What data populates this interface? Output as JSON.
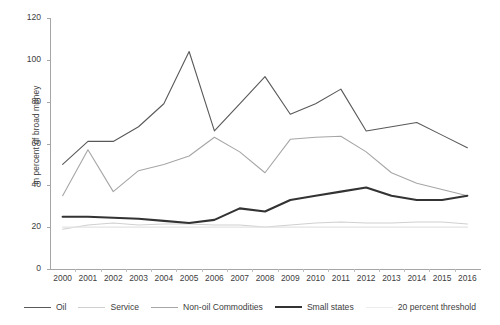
{
  "chart_data": {
    "type": "line",
    "title": "",
    "xlabel": "",
    "ylabel": "in percent of broad money",
    "ylim": [
      0,
      120
    ],
    "ytick_labels": [
      "0",
      "20",
      "40",
      "60",
      "80",
      "100",
      "120"
    ],
    "yticks": [
      0,
      20,
      40,
      60,
      80,
      100,
      120
    ],
    "grid": false,
    "legend_position": "bottom",
    "categories": [
      "2000",
      "2001",
      "2002",
      "2003",
      "2004",
      "2005",
      "2006",
      "2007",
      "2008",
      "2009",
      "2010",
      "2011",
      "2012",
      "2013",
      "2014",
      "2015",
      "2016"
    ],
    "series": [
      {
        "name": "Oil",
        "color": "#595959",
        "width": 1.1,
        "values": [
          50,
          61,
          61,
          68,
          79,
          104,
          66,
          79,
          92,
          74,
          79,
          86,
          66,
          68,
          70,
          64,
          58
        ]
      },
      {
        "name": "Service",
        "color": "#d0d0d0",
        "width": 1.1,
        "values": [
          19,
          21,
          22,
          21,
          21.5,
          21.5,
          21,
          21,
          20,
          21,
          22,
          22.5,
          22,
          22,
          22.5,
          22.5,
          21.5
        ]
      },
      {
        "name": "Non-oil Commodities",
        "color": "#a6a6a6",
        "width": 1.1,
        "values": [
          35,
          57,
          37,
          47,
          50,
          54,
          63,
          56,
          46,
          62,
          63,
          63.5,
          56,
          46,
          41,
          38,
          35
        ]
      },
      {
        "name": "Small states",
        "color": "#333333",
        "width": 2.1,
        "values": [
          25,
          25,
          24.5,
          24,
          23,
          22,
          23.5,
          29,
          27.5,
          33,
          35,
          37,
          39,
          35,
          33,
          33,
          35
        ]
      },
      {
        "name": "20 percent threshold",
        "color": "#e4e4e4",
        "width": 1.4,
        "values": [
          20,
          20,
          20,
          20,
          20,
          20,
          20,
          20,
          20,
          20,
          20,
          20,
          20,
          20,
          20,
          20,
          20
        ]
      }
    ]
  },
  "legend": {
    "items": [
      {
        "label": "Oil",
        "color": "#595959",
        "width": 1.3
      },
      {
        "label": "Service",
        "color": "#d0d0d0",
        "width": 1.3
      },
      {
        "label": "Non-oil Commodities",
        "color": "#a6a6a6",
        "width": 1.3
      },
      {
        "label": "Small states",
        "color": "#333333",
        "width": 2.2
      },
      {
        "label": "20 percent threshold",
        "color": "#ececec",
        "width": 1.6
      }
    ]
  },
  "colors": {
    "axis": "#a6a6a6",
    "text": "#404040",
    "background": "#ffffff"
  }
}
